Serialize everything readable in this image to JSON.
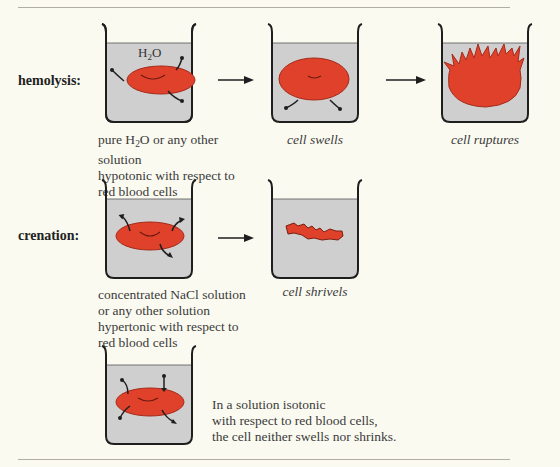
{
  "figure": {
    "rows": [
      {
        "label": "hemolysis:",
        "stages": [
          {
            "id": "hypotonic",
            "beaker_label_prefix": "H",
            "beaker_label_sub": "2",
            "beaker_label_suffix": "O",
            "caption_lines": [
              "pure H₂O or any other solution",
              "hypotonic with respect to",
              "red blood cells"
            ],
            "water_flow": "into cell"
          },
          {
            "id": "swelling",
            "caption": "cell swells",
            "water_flow": "into cell"
          },
          {
            "id": "rupture",
            "caption": "cell ruptures"
          }
        ]
      },
      {
        "label": "crenation:",
        "stages": [
          {
            "id": "hypertonic",
            "caption_lines": [
              "concentrated NaCl solution",
              "or any other solution",
              "hypertonic with respect to",
              "red blood cells"
            ],
            "water_flow": "out of cell"
          },
          {
            "id": "shriveled",
            "caption": "cell shrivels"
          }
        ]
      },
      {
        "label": "",
        "stages": [
          {
            "id": "isotonic",
            "caption_lines": [
              "In a solution isotonic",
              "with respect to red blood cells,",
              "the cell neither swells nor shrinks."
            ],
            "water_flow": "balanced"
          }
        ]
      }
    ],
    "colors": {
      "background": "#fbfaf1",
      "solution": "#cfcfcf",
      "cell": "#e0412a",
      "outline": "#1e1e1e",
      "rule": "#b0aea6"
    }
  }
}
